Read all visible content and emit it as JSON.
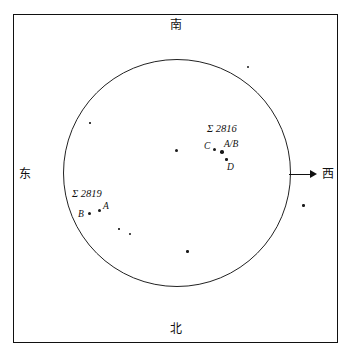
{
  "figure": {
    "type": "star-chart",
    "title": "",
    "frame": {
      "x": 13,
      "y": 14,
      "width": 325,
      "height": 329
    },
    "field_circle": {
      "cx": 177,
      "cy": 173,
      "r": 114
    }
  },
  "directions": [
    {
      "name": "north-label",
      "label": "南",
      "x": 170,
      "y": 19
    },
    {
      "name": "south-label",
      "label": "北",
      "x": 170,
      "y": 323
    },
    {
      "name": "east-label",
      "label": "东",
      "x": 19,
      "y": 168
    },
    {
      "name": "west-label",
      "label": "西",
      "x": 322,
      "y": 168
    }
  ],
  "drift_arrow": {
    "name": "drift-direction-arrow",
    "from_x": 289,
    "to_x": 314,
    "y": 174
  },
  "double_stars": [
    {
      "id": "sigma-2816",
      "designation": "Σ 2816",
      "label_x": 207,
      "label_y": 124,
      "components": [
        {
          "label": "C",
          "x": 204,
          "y": 144,
          "star_x": 214,
          "star_y": 149,
          "size": 2.5
        },
        {
          "label": "A/B",
          "x": 224,
          "y": 142,
          "star_x": 221,
          "star_y": 152,
          "size": 3
        },
        {
          "label": "D",
          "x": 228,
          "y": 164,
          "star_x": 225,
          "star_y": 160,
          "size": 2
        }
      ]
    },
    {
      "id": "sigma-2819",
      "designation": "Σ 2819",
      "label_x": 72,
      "label_y": 190,
      "components": [
        {
          "label": "A",
          "x": 103,
          "y": 203,
          "star_x": 99,
          "star_y": 208,
          "size": 2.5
        },
        {
          "label": "B",
          "x": 78,
          "y": 211,
          "star_x": 89,
          "star_y": 212,
          "size": 2.5
        }
      ]
    }
  ],
  "field_stars": [
    {
      "x": 176,
      "y": 150,
      "size": 2.5
    },
    {
      "x": 247,
      "y": 66,
      "size": 1.8
    },
    {
      "x": 303,
      "y": 204,
      "size": 2.2
    },
    {
      "x": 186,
      "y": 250,
      "size": 2.2
    },
    {
      "x": 129,
      "y": 233,
      "size": 1.6
    },
    {
      "x": 118,
      "y": 228,
      "size": 1.4
    },
    {
      "x": 89,
      "y": 122,
      "size": 1.4
    }
  ]
}
